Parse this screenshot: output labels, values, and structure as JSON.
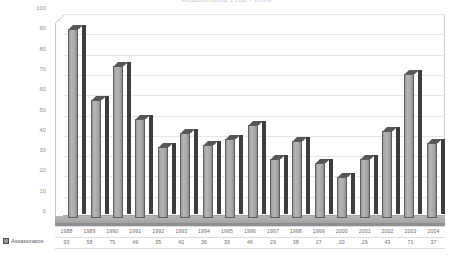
{
  "chart_data": {
    "type": "bar",
    "title": "Assassinatos 1988 - 2004",
    "xlabel": "",
    "ylabel": "",
    "ylim": [
      0,
      100
    ],
    "ytick_step": 10,
    "yticks": [
      "100",
      "90",
      "80",
      "70",
      "60",
      "50",
      "40",
      "30",
      "20",
      "10",
      "0"
    ],
    "grid": true,
    "legend_position": "bottom-left",
    "categories": [
      "1988",
      "1989",
      "1990",
      "1991",
      "1992",
      "1993",
      "1994",
      "1995",
      "1996",
      "1997",
      "1998",
      "1999",
      "2000",
      "2001",
      "2002",
      "2003",
      "2004"
    ],
    "series": [
      {
        "name": "Assassinatos",
        "values": [
          93,
          58,
          75,
          49,
          35,
          42,
          36,
          39,
          46,
          29,
          38,
          27,
          20,
          29,
          43,
          71,
          37
        ]
      }
    ],
    "data_table_visible": true
  },
  "legend": {
    "marker": "series-swatch",
    "label": "Assassinatos"
  },
  "colors": {
    "bar_face": "#ababab",
    "bar_side": "#3d3d3d",
    "bar_top": "#55555a",
    "floor": "#a8a8a8",
    "gridline": "#e6e6ea",
    "text": "#6e6e75",
    "plot_background": "#ffffff"
  }
}
